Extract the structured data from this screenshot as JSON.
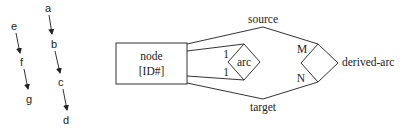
{
  "chain_left": {
    "nodes": [
      "e",
      "f",
      "g"
    ]
  },
  "chain_right": {
    "nodes": [
      "a",
      "b",
      "c",
      "d"
    ]
  },
  "er_diagram": {
    "entity": {
      "line1": "node",
      "line2": "[ID#]"
    },
    "relationship": {
      "label": "arc",
      "card_top": "1",
      "card_bottom": "1"
    },
    "derived": {
      "label": "derived-arc",
      "card_top": "M",
      "card_bottom": "N"
    },
    "roles": {
      "top": "source",
      "bottom": "target"
    }
  }
}
